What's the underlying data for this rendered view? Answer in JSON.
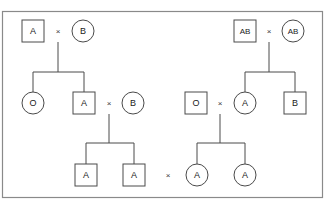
{
  "figure": {
    "border_color": "#8a8a8a",
    "line_color": "#4a4a4a",
    "text_color": "#1a1a1a",
    "background": "#ffffff",
    "cross_symbol": "×"
  },
  "legend_shapes": {
    "square": "male",
    "circle": "female"
  },
  "pedigrees": [
    {
      "id": "left-pedigree",
      "generations": [
        {
          "id": "left-gen1",
          "label": "generation-1",
          "individuals": [
            {
              "id": "l1-father",
              "shape": "square",
              "sex": "male",
              "blood_type": "A",
              "cx": 33,
              "cy": 31
            },
            {
              "id": "l1-mother",
              "shape": "circle",
              "sex": "female",
              "blood_type": "B",
              "cx": 83,
              "cy": 31
            }
          ],
          "mating": {
            "x": 58,
            "y": 31,
            "symbol": "×"
          }
        },
        {
          "id": "left-gen2",
          "label": "generation-2",
          "individuals": [
            {
              "id": "l2-daughter",
              "shape": "circle",
              "sex": "female",
              "blood_type": "O",
              "cx": 33,
              "cy": 103
            },
            {
              "id": "l2-son",
              "shape": "square",
              "sex": "male",
              "blood_type": "A",
              "cx": 84,
              "cy": 103
            },
            {
              "id": "l2-spouse",
              "shape": "circle",
              "sex": "female",
              "blood_type": "B",
              "cx": 133,
              "cy": 103
            }
          ],
          "mating": {
            "x": 109,
            "y": 103,
            "symbol": "×"
          }
        },
        {
          "id": "left-gen3",
          "label": "generation-3",
          "individuals": [
            {
              "id": "l3-son1",
              "shape": "square",
              "sex": "male",
              "blood_type": "A",
              "cx": 86,
              "cy": 175
            },
            {
              "id": "l3-son2",
              "shape": "square",
              "sex": "male",
              "blood_type": "A",
              "cx": 134,
              "cy": 175
            }
          ]
        }
      ],
      "descent_lines": [
        {
          "id": "left-d1-drop",
          "type": "drop-from-mating",
          "x1": 58,
          "y1": 42,
          "x2": 58,
          "y2": 72
        },
        {
          "id": "left-d1-sib",
          "type": "sibship-bar",
          "x1": 33,
          "y1": 72,
          "x2": 84,
          "y2": 72
        },
        {
          "id": "left-d1-child-a",
          "type": "child-stem",
          "x1": 33,
          "y1": 72,
          "x2": 33,
          "y2": 92
        },
        {
          "id": "left-d1-child-b",
          "type": "child-stem",
          "x1": 84,
          "y1": 72,
          "x2": 84,
          "y2": 92
        },
        {
          "id": "left-d2-drop",
          "type": "drop-from-mating",
          "x1": 109,
          "y1": 114,
          "x2": 109,
          "y2": 143
        },
        {
          "id": "left-d2-sib",
          "type": "sibship-bar",
          "x1": 86,
          "y1": 143,
          "x2": 134,
          "y2": 143
        },
        {
          "id": "left-d2-child-a",
          "type": "child-stem",
          "x1": 86,
          "y1": 143,
          "x2": 86,
          "y2": 164
        },
        {
          "id": "left-d2-child-b",
          "type": "child-stem",
          "x1": 134,
          "y1": 143,
          "x2": 134,
          "y2": 164
        }
      ]
    },
    {
      "id": "right-pedigree",
      "generations": [
        {
          "id": "right-gen1",
          "label": "generation-1",
          "individuals": [
            {
              "id": "r1-father",
              "shape": "square",
              "sex": "male",
              "blood_type": "AB",
              "cx": 245,
              "cy": 31
            },
            {
              "id": "r1-mother",
              "shape": "circle",
              "sex": "female",
              "blood_type": "AB",
              "cx": 293,
              "cy": 31
            }
          ],
          "mating": {
            "x": 269,
            "y": 31,
            "symbol": "×"
          }
        },
        {
          "id": "right-gen2",
          "label": "generation-2",
          "individuals": [
            {
              "id": "r2-spouse",
              "shape": "square",
              "sex": "male",
              "blood_type": "O",
              "cx": 196,
              "cy": 103
            },
            {
              "id": "r2-daughter",
              "shape": "circle",
              "sex": "female",
              "blood_type": "A",
              "cx": 245,
              "cy": 103
            },
            {
              "id": "r2-son",
              "shape": "square",
              "sex": "male",
              "blood_type": "B",
              "cx": 295,
              "cy": 103
            }
          ],
          "mating": {
            "x": 220,
            "y": 103,
            "symbol": "×"
          }
        },
        {
          "id": "right-gen3",
          "label": "generation-3",
          "individuals": [
            {
              "id": "r3-daughter1",
              "shape": "circle",
              "sex": "female",
              "blood_type": "A",
              "cx": 197,
              "cy": 175
            },
            {
              "id": "r3-daughter2",
              "shape": "circle",
              "sex": "female",
              "blood_type": "A",
              "cx": 245,
              "cy": 175
            }
          ]
        }
      ],
      "descent_lines": [
        {
          "id": "right-d1-drop",
          "type": "drop-from-mating",
          "x1": 269,
          "y1": 42,
          "x2": 269,
          "y2": 72
        },
        {
          "id": "right-d1-sib",
          "type": "sibship-bar",
          "x1": 245,
          "y1": 72,
          "x2": 295,
          "y2": 72
        },
        {
          "id": "right-d1-child-a",
          "type": "child-stem",
          "x1": 245,
          "y1": 72,
          "x2": 245,
          "y2": 92
        },
        {
          "id": "right-d1-child-b",
          "type": "child-stem",
          "x1": 295,
          "y1": 72,
          "x2": 295,
          "y2": 92
        },
        {
          "id": "right-d2-drop",
          "type": "drop-from-mating",
          "x1": 220,
          "y1": 114,
          "x2": 220,
          "y2": 143
        },
        {
          "id": "right-d2-sib",
          "type": "sibship-bar",
          "x1": 197,
          "y1": 143,
          "x2": 245,
          "y2": 143
        },
        {
          "id": "right-d2-child-a",
          "type": "child-stem",
          "x1": 197,
          "y1": 143,
          "x2": 197,
          "y2": 164
        },
        {
          "id": "right-d2-child-b",
          "type": "child-stem",
          "x1": 245,
          "y1": 143,
          "x2": 245,
          "y2": 164
        }
      ]
    }
  ],
  "inter_group_mating": {
    "id": "bottom-mating",
    "x": 168,
    "y": 175,
    "symbol": "×"
  },
  "frame": {
    "x": 2.5,
    "y": 11.5,
    "width": 320,
    "height": 186
  }
}
